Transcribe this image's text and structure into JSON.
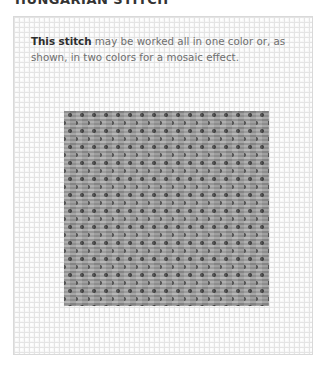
{
  "page": {
    "heading": "HUNGARIAN STITCH",
    "caption": {
      "lead": "This stitch",
      "rest": " may be worked all in one color or, as shown, in two colors for a mosaic effect."
    },
    "figure": {
      "description": "needlepoint canvas sample",
      "canvas_color": "#f7f7f7",
      "stitch_colors": [
        "#9d9d9d",
        "#8c8c8c",
        "#4a4a4a"
      ]
    }
  }
}
